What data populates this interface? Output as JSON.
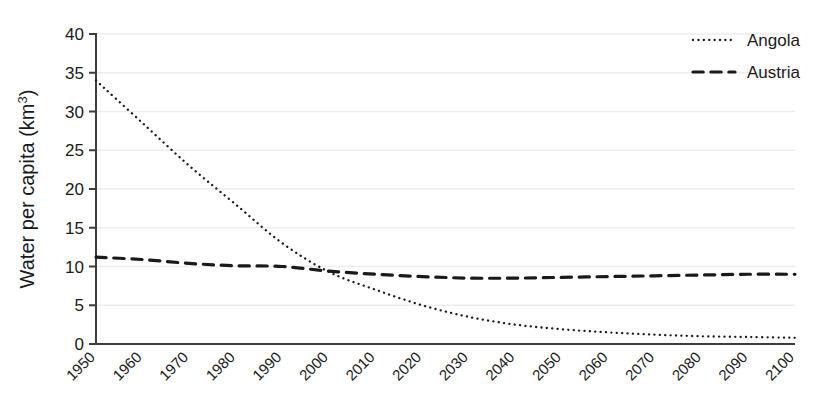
{
  "chart_data": {
    "type": "line",
    "title": "",
    "subtitle": "",
    "xlabel": "",
    "ylabel": "Water per capita (km",
    "ylabel_sup": "3",
    "ylabel_tail": ")",
    "ylabel_full": "Water per capita (km3)",
    "grid": true,
    "grid_axis": "y",
    "legend_position": "top-right",
    "xlim": [
      1950,
      2100
    ],
    "ylim": [
      0,
      40
    ],
    "yticks": [
      0,
      5,
      10,
      15,
      20,
      25,
      30,
      35,
      40
    ],
    "ytick_labels": [
      "0",
      "5",
      "10",
      "15",
      "20",
      "25",
      "30",
      "35",
      "40"
    ],
    "x": [
      1950,
      1960,
      1970,
      1980,
      1990,
      2000,
      2010,
      2020,
      2030,
      2040,
      2050,
      2060,
      2070,
      2080,
      2090,
      2100
    ],
    "categories": [
      "1950",
      "1960",
      "1970",
      "1980",
      "1990",
      "2000",
      "2010",
      "2020",
      "2030",
      "2040",
      "2050",
      "2060",
      "2070",
      "2080",
      "2090",
      "2100"
    ],
    "xtick_rotation": -45,
    "series": [
      {
        "name": "Angola",
        "linestyle": "dotted",
        "color": "#1a1a1a",
        "linewidth": 2.3,
        "values": [
          34.0,
          28.5,
          23.0,
          18.0,
          13.0,
          9.3,
          7.0,
          5.0,
          3.5,
          2.5,
          1.9,
          1.5,
          1.2,
          1.0,
          0.9,
          0.8
        ]
      },
      {
        "name": "Austria",
        "linestyle": "dashed",
        "color": "#1a1a1a",
        "linewidth": 3.2,
        "values": [
          11.2,
          10.9,
          10.4,
          10.1,
          10.0,
          9.4,
          9.0,
          8.7,
          8.5,
          8.5,
          8.6,
          8.7,
          8.8,
          8.9,
          9.0,
          9.0
        ]
      }
    ]
  },
  "legend": {
    "entries": [
      {
        "label": "Angola",
        "style": "dotted"
      },
      {
        "label": "Austria",
        "style": "dashed"
      }
    ]
  },
  "colors": {
    "axis": "#3d3d3d",
    "grid": "#ededed",
    "text": "#1a1a1a",
    "background": "#ffffff"
  }
}
